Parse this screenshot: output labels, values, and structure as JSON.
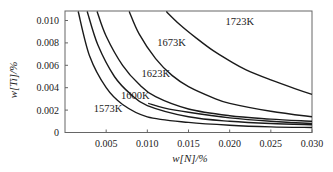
{
  "chart_data": {
    "type": "line",
    "title": "",
    "xlabel": "w[N]/%",
    "ylabel": "w[Ti]/%",
    "xlim": [
      0,
      0.03
    ],
    "ylim": [
      0,
      0.0108
    ],
    "grid": false,
    "legend": "inline curve labels",
    "x_ticks": [
      "0.005",
      "0.010",
      "0.015",
      "0.020",
      "0.025",
      "0.030"
    ],
    "x_tick_values": [
      0.005,
      0.01,
      0.015,
      0.02,
      0.025,
      0.03
    ],
    "y_ticks": [
      "0",
      "0.002",
      "0.004",
      "0.006",
      "0.008",
      "0.010"
    ],
    "y_tick_values": [
      0,
      0.002,
      0.004,
      0.006,
      0.008,
      0.01
    ],
    "series": [
      {
        "name": "1573K",
        "label": "1573K",
        "label_pos": [
          0.0035,
          0.0018
        ],
        "x": [
          0.0016,
          0.003,
          0.005,
          0.007,
          0.01,
          0.015,
          0.02,
          0.025,
          0.03
        ],
        "y": [
          0.0108,
          0.0068,
          0.004,
          0.0025,
          0.0014,
          0.0009,
          0.00065,
          0.0005,
          0.00045
        ]
      },
      {
        "name": "curve-2",
        "label": "",
        "label_pos": null,
        "x": [
          0.0027,
          0.004,
          0.006,
          0.008,
          0.01,
          0.015,
          0.02,
          0.025,
          0.03
        ],
        "y": [
          0.0108,
          0.0078,
          0.005,
          0.0034,
          0.0024,
          0.0014,
          0.001,
          0.0008,
          0.0007
        ]
      },
      {
        "name": "1623K",
        "label": "1623K",
        "label_pos": [
          0.0093,
          0.005
        ],
        "x": [
          0.0039,
          0.005,
          0.007,
          0.009,
          0.011,
          0.015,
          0.02,
          0.025,
          0.03
        ],
        "y": [
          0.0108,
          0.0086,
          0.006,
          0.0043,
          0.0032,
          0.0021,
          0.0015,
          0.0012,
          0.001
        ]
      },
      {
        "name": "1600K",
        "label": "1600K",
        "label_pos": [
          0.0068,
          0.003
        ],
        "x": [
          0.0101,
          0.012,
          0.015,
          0.02,
          0.025,
          0.03
        ],
        "y": [
          0.0026,
          0.0022,
          0.0018,
          0.0013,
          0.001,
          0.0008
        ]
      },
      {
        "name": "1673K",
        "label": "1673K",
        "label_pos": [
          0.0112,
          0.0077
        ],
        "x": [
          0.0078,
          0.009,
          0.011,
          0.013,
          0.015,
          0.018,
          0.02,
          0.025,
          0.03
        ],
        "y": [
          0.0108,
          0.0088,
          0.0066,
          0.0051,
          0.0041,
          0.0031,
          0.0026,
          0.0019,
          0.0014
        ]
      },
      {
        "name": "1723K",
        "label": "1723K",
        "label_pos": [
          0.0195,
          0.0096
        ],
        "x": [
          0.0123,
          0.014,
          0.016,
          0.018,
          0.02,
          0.022,
          0.025,
          0.028,
          0.03
        ],
        "y": [
          0.0108,
          0.0096,
          0.0084,
          0.0073,
          0.0064,
          0.0056,
          0.0047,
          0.0039,
          0.0034
        ]
      }
    ]
  },
  "style": {
    "line_color": "#1a1a1a",
    "axis_color": "#555555",
    "background": "#ffffff"
  }
}
